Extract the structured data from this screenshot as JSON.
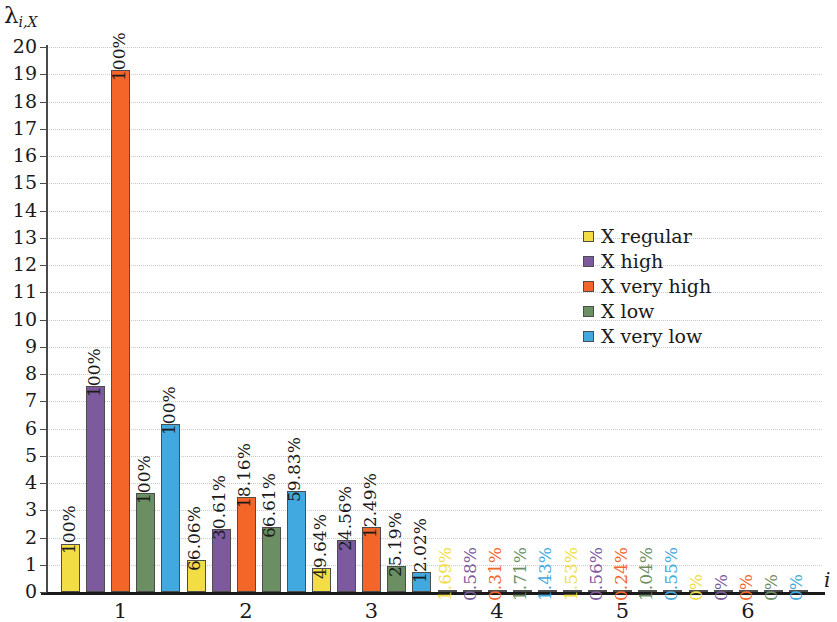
{
  "chart_data": {
    "type": "bar",
    "title": "",
    "xlabel": "i",
    "ylabel": "λ",
    "ylabel_sub": "i,X",
    "categories": [
      "1",
      "2",
      "3",
      "4",
      "5",
      "6"
    ],
    "ylim": [
      0,
      20
    ],
    "yticks": [
      0,
      1,
      2,
      3,
      4,
      5,
      6,
      7,
      8,
      9,
      10,
      11,
      12,
      13,
      14,
      15,
      16,
      17,
      18,
      19,
      20
    ],
    "grid": true,
    "legend_position": "center-right",
    "series": [
      {
        "name": "X regular",
        "color": "#f2dd44",
        "values": [
          1.78,
          1.17,
          0.88,
          0.04,
          0.03,
          0.0
        ],
        "labels": [
          "100%",
          "66.06%",
          "49.64%",
          "1.69%",
          "1.53%",
          "0%"
        ]
      },
      {
        "name": "X high",
        "color": "#7d5a9e",
        "values": [
          7.55,
          2.32,
          1.9,
          0.02,
          0.02,
          0.0
        ],
        "labels": [
          "100%",
          "30.61%",
          "24.56%",
          "0.58%",
          "0.56%",
          "0%"
        ]
      },
      {
        "name": "X very high",
        "color": "#f4652a",
        "values": [
          19.15,
          3.5,
          2.4,
          0.02,
          0.02,
          0.0
        ],
        "labels": [
          "100%",
          "18.16%",
          "12.49%",
          "0.31%",
          "0.24%",
          "0%"
        ]
      },
      {
        "name": "X low",
        "color": "#6b8e62",
        "values": [
          3.65,
          2.4,
          0.95,
          0.03,
          0.02,
          0.0
        ],
        "labels": [
          "100%",
          "66.61%",
          "25.19%",
          "1.71%",
          "1.04%",
          "0%"
        ]
      },
      {
        "name": "X very low",
        "color": "#41a9e0",
        "values": [
          6.15,
          3.72,
          0.75,
          0.09,
          0.02,
          0.0
        ],
        "labels": [
          "100%",
          "59.83%",
          "12.02%",
          "1.43%",
          "0.55%",
          "0%"
        ]
      }
    ]
  },
  "legend": {
    "items": [
      {
        "label": "X regular",
        "color": "#f2dd44"
      },
      {
        "label": "X high",
        "color": "#7d5a9e"
      },
      {
        "label": "X very high",
        "color": "#f4652a"
      },
      {
        "label": "X low",
        "color": "#6b8e62"
      },
      {
        "label": "X very low",
        "color": "#41a9e0"
      }
    ]
  }
}
